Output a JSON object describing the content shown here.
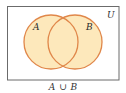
{
  "diagram": {
    "type": "venn",
    "universe_label": "U",
    "sets": [
      {
        "label": "A"
      },
      {
        "label": "B"
      }
    ],
    "shaded_region": "A ∪ B",
    "caption": {
      "left": "A",
      "operator": "∪",
      "right": "B"
    },
    "colors": {
      "fill": "#fde8bb",
      "stroke": "#e0874a",
      "frame": "#6b6b6b",
      "background": "#ffffff"
    }
  }
}
